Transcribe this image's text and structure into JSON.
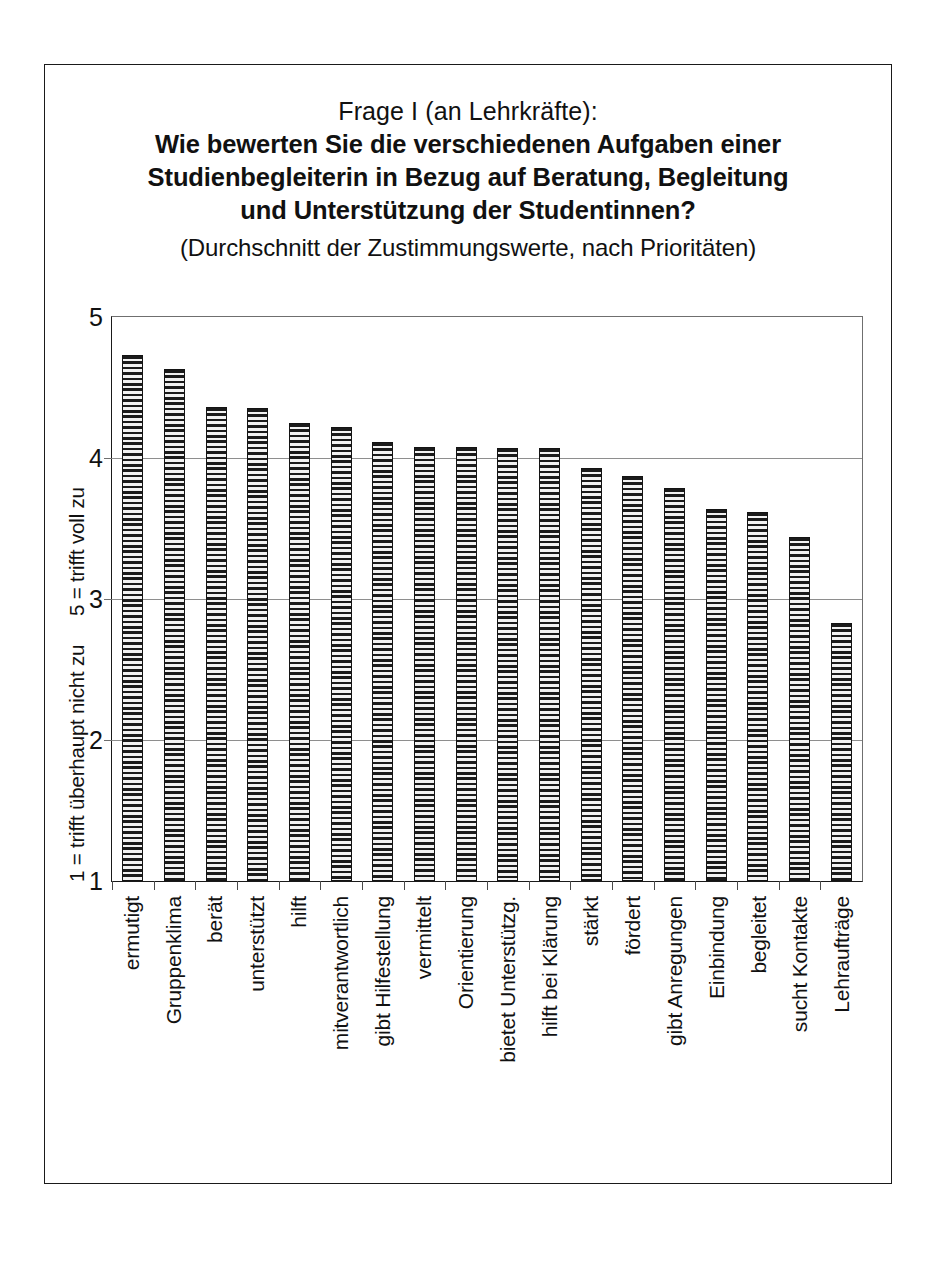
{
  "title": {
    "line1": "Frage I (an Lehrkräfte):",
    "line2": "Wie bewerten Sie die verschiedenen Aufgaben einer",
    "line3": "Studienbegleiterin in Bezug auf Beratung, Begleitung",
    "line4": "und Unterstützung der Studentinnen?",
    "subtitle": "(Durchschnitt der Zustimmungswerte, nach Prioritäten)"
  },
  "axis": {
    "y_title_high": "5 = trifft voll zu",
    "y_title_low": "1 = trifft überhaupt nicht zu",
    "y_ticks": [
      "5",
      "4",
      "3",
      "2",
      "1"
    ]
  },
  "chart_data": {
    "type": "bar",
    "title": "Frage I (an Lehrkräfte): Wie bewerten Sie die verschiedenen Aufgaben einer Studienbegleiterin in Bezug auf Beratung, Begleitung und Unterstützung der Studentinnen?",
    "subtitle": "(Durchschnitt der Zustimmungswerte, nach Prioritäten)",
    "xlabel": "",
    "ylabel": "1 = trifft überhaupt nicht zu / 5 = trifft voll zu",
    "ylim": [
      1,
      5
    ],
    "yticks": [
      1,
      2,
      3,
      4,
      5
    ],
    "grid": true,
    "legend": false,
    "categories": [
      "ermutigt",
      "Gruppenklima",
      "berät",
      "unterstützt",
      "hilft",
      "mitverantwortlich",
      "gibt Hilfestellung",
      "vermittelt",
      "Orientierung",
      "bietet Unterstützg.",
      "hilft bei Klärung",
      "stärkt",
      "fördert",
      "gibt Anregungen",
      "Einbindung",
      "begleitet",
      "sucht Kontakte",
      "Lehraufträge"
    ],
    "values": [
      4.72,
      4.62,
      4.35,
      4.34,
      4.24,
      4.21,
      4.1,
      4.07,
      4.07,
      4.06,
      4.06,
      3.92,
      3.86,
      3.78,
      3.63,
      3.61,
      3.43,
      2.82
    ]
  },
  "colors": {
    "bar_stripe": "#1b1b1b",
    "bar_fill": "#f2f2f2",
    "frame": "#1a1a1a",
    "gridline": "#8e8e8e"
  }
}
